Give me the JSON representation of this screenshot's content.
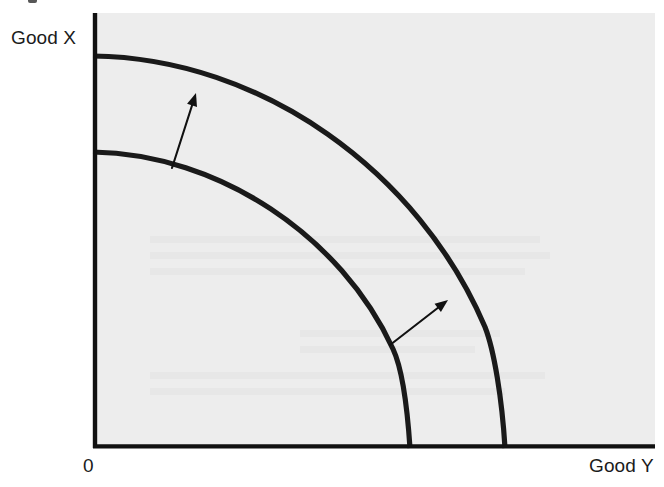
{
  "figure": {
    "kind": "production-possibilities-frontier",
    "title": "",
    "background_color": "#ffffff",
    "plot_fill_color": "#ededed",
    "axis_color": "#111111",
    "curve_color": "#1a1a1a",
    "arrow_color": "#111111"
  },
  "labels": {
    "y_axis": "Good X",
    "x_axis": "Good Y",
    "origin": "0"
  },
  "chart_data": {
    "type": "line",
    "title": "",
    "xlabel": "Good Y",
    "ylabel": "Good X",
    "subtitle": "",
    "grid": false,
    "legend_position": "none",
    "annotations": [
      {
        "name": "outward-shift-arrow-upper",
        "kind": "arrow",
        "from": [
          172,
          168
        ],
        "to": [
          196,
          93
        ],
        "label": ""
      },
      {
        "name": "outward-shift-arrow-lower",
        "kind": "arrow",
        "from": [
          390,
          345
        ],
        "to": [
          448,
          300
        ],
        "label": ""
      }
    ],
    "axis_pixel_frame": {
      "origin": [
        93,
        448
      ],
      "x_axis_end": [
        655,
        448
      ],
      "y_axis_end": [
        93,
        13
      ]
    },
    "series": [
      {
        "name": "Initial production possibilities frontier",
        "role": "inner-curve",
        "y_intercept_px": [
          93,
          152
        ],
        "x_intercept_px": [
          410,
          448
        ],
        "path": "M 93 152 C 219 154, 341 236, 393 349 C 401 366, 407 403, 410 448",
        "x": [
          0,
          0.15,
          0.3,
          0.45,
          0.6,
          0.75,
          0.88,
          0.96,
          1.0
        ],
        "values": [
          1.0,
          0.995,
          0.975,
          0.935,
          0.865,
          0.745,
          0.56,
          0.33,
          0.0
        ]
      },
      {
        "name": "Expanded production possibilities frontier",
        "role": "outer-curve",
        "y_intercept_px": [
          93,
          56
        ],
        "x_intercept_px": [
          505,
          448
        ],
        "path": "M 93 56 C 262 58, 419 172, 485 327 C 494 350, 502 398, 505 448",
        "x": [
          0,
          0.15,
          0.3,
          0.45,
          0.6,
          0.75,
          0.88,
          0.96,
          1.0
        ],
        "values": [
          1.0,
          0.995,
          0.975,
          0.935,
          0.865,
          0.745,
          0.56,
          0.33,
          0.0
        ]
      }
    ],
    "xlim": [
      0,
      1.4
    ],
    "ylim": [
      0,
      1.15
    ]
  }
}
